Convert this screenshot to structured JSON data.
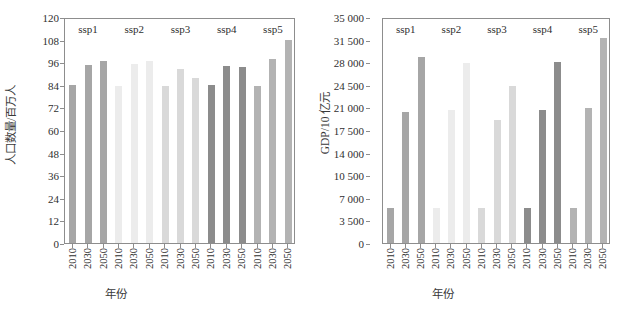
{
  "figure": {
    "panels": [
      {
        "id": "population",
        "ytitle": "人口数量/百万人",
        "xtitle": "年份"
      },
      {
        "id": "gdp",
        "ytitle": "GDP/10 亿元",
        "xtitle": "年份"
      }
    ],
    "group_labels": [
      "ssp1",
      "ssp2",
      "ssp3",
      "ssp4",
      "ssp5"
    ],
    "colors": {
      "ssp1": "#a6a6a6",
      "ssp2": "#ececec",
      "ssp3": "#d9d9d9",
      "ssp4": "#8c8c8c",
      "ssp5": "#b3b3b3",
      "axis": "#8d8d8d",
      "text": "#2f2f2f",
      "background": "#ffffff"
    }
  },
  "chart_data": [
    {
      "type": "bar",
      "title": "",
      "xlabel": "年份",
      "ylabel": "人口数量/百万人",
      "ylim": [
        0,
        120
      ],
      "yticks": [
        0,
        12,
        24,
        36,
        48,
        60,
        72,
        84,
        96,
        108,
        120
      ],
      "ytick_labels": [
        "0",
        "12",
        "24",
        "36",
        "48",
        "60",
        "72",
        "84",
        "96",
        "108",
        "120"
      ],
      "grid": false,
      "legend": "none",
      "categories": [
        "2010",
        "2030",
        "2050",
        "2010",
        "2030",
        "2050",
        "2010",
        "2030",
        "2050",
        "2010",
        "2030",
        "2050",
        "2010",
        "2030",
        "2050"
      ],
      "groups": [
        "ssp1",
        "ssp1",
        "ssp1",
        "ssp2",
        "ssp2",
        "ssp2",
        "ssp3",
        "ssp3",
        "ssp3",
        "ssp4",
        "ssp4",
        "ssp4",
        "ssp5",
        "ssp5",
        "ssp5"
      ],
      "values": [
        84.4,
        95.6,
        97.5,
        84.3,
        96.0,
        97.4,
        84.3,
        93.3,
        88.2,
        84.4,
        94.8,
        94.3,
        84.3,
        98.7,
        108.5
      ]
    },
    {
      "type": "bar",
      "title": "",
      "xlabel": "年份",
      "ylabel": "GDP/10 亿元",
      "ylim": [
        0,
        35000
      ],
      "yticks": [
        0,
        3500,
        7000,
        10500,
        14000,
        17500,
        21000,
        24500,
        28000,
        31500,
        35000
      ],
      "ytick_labels": [
        "0",
        "3 500",
        "7 000",
        "10 500",
        "14 000",
        "17 500",
        "21 000",
        "24 500",
        "28 000",
        "31 500",
        "35 000"
      ],
      "grid": false,
      "legend": "none",
      "categories": [
        "2010",
        "2030",
        "2050",
        "2010",
        "2030",
        "2050",
        "2010",
        "2030",
        "2050",
        "2010",
        "2030",
        "2050",
        "2010",
        "2030",
        "2050"
      ],
      "groups": [
        "ssp1",
        "ssp1",
        "ssp1",
        "ssp2",
        "ssp2",
        "ssp2",
        "ssp3",
        "ssp3",
        "ssp3",
        "ssp4",
        "ssp4",
        "ssp4",
        "ssp5",
        "ssp5",
        "ssp5"
      ],
      "values": [
        5500,
        20500,
        29100,
        5450,
        20800,
        28100,
        5450,
        19200,
        24600,
        5500,
        20800,
        28300,
        5450,
        21050,
        32000
      ]
    }
  ]
}
